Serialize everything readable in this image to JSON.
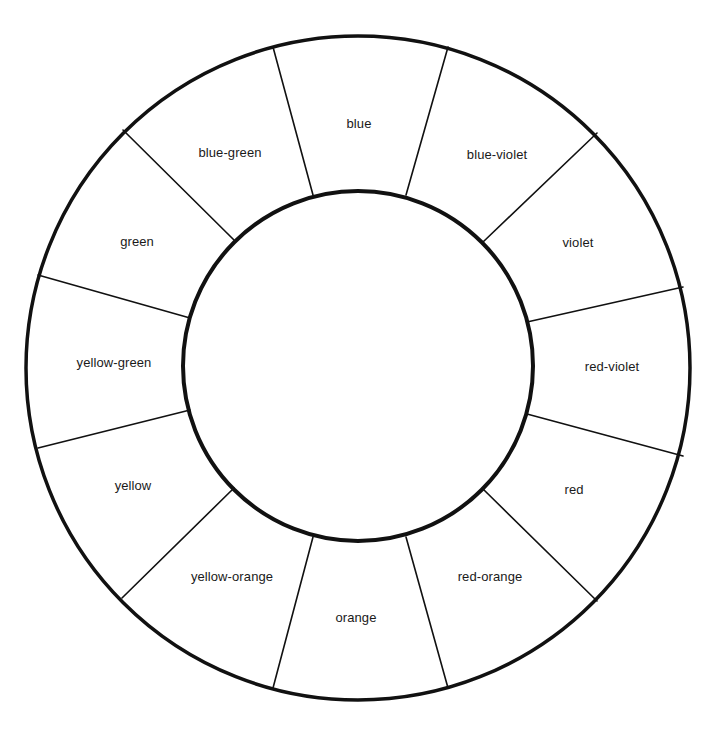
{
  "diagram": {
    "type": "color-wheel",
    "segment_count": 12,
    "colors": {
      "stroke": "#111111",
      "background": "#ffffff",
      "text": "#1a1a1a"
    },
    "segments": [
      {
        "label": "blue",
        "x": 359,
        "y": 123
      },
      {
        "label": "blue-violet",
        "x": 497,
        "y": 154
      },
      {
        "label": "violet",
        "x": 578,
        "y": 242
      },
      {
        "label": "red-violet",
        "x": 612,
        "y": 366
      },
      {
        "label": "red",
        "x": 574,
        "y": 489
      },
      {
        "label": "red-orange",
        "x": 490,
        "y": 576
      },
      {
        "label": "orange",
        "x": 356,
        "y": 617
      },
      {
        "label": "yellow-orange",
        "x": 232,
        "y": 576
      },
      {
        "label": "yellow",
        "x": 133,
        "y": 485
      },
      {
        "label": "yellow-green",
        "x": 114,
        "y": 362
      },
      {
        "label": "green",
        "x": 137,
        "y": 241
      },
      {
        "label": "blue-green",
        "x": 230,
        "y": 152
      }
    ]
  }
}
